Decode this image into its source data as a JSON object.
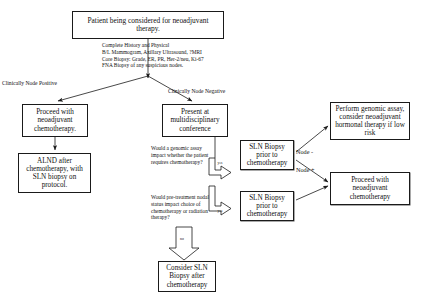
{
  "diagram": {
    "colors": {
      "background": "#ffffff",
      "stroke": "#1a1a1a",
      "text": "#111111"
    },
    "nodes": {
      "root": "Patient being considered for neoadjuvant therapy.",
      "proceed_neoadjuvant": "Proceed with neoadjuvant chemotherapy.",
      "alnd": "ALND after chemotherapy, with SLN biopsy on protocol.",
      "conference": "Present at multidisciplinary conference",
      "sln_biopsy_top": "SLN Biopsy prior to chemotherapy",
      "sln_biopsy_bottom": "SLN Biopsy prior to chemotherapy",
      "genomic_assay": "Perform genomic assay, consider neoadjuvant hormonal therapy if low risk",
      "proceed_neoadjuvant_right": "Proceed with neoadjuvant chemotherapy",
      "consider_sln": "Consider SLN Biopsy after chemotherapy"
    },
    "annotations": {
      "workup": "Complete History and Physical\nB/L Mammogram, Axillary Ultrasound, ?MRI\nCore Biopsy: Grade, ER, PR, Her-2/neu, Ki-67\nFNA Biopsy of any suspicious nodes.",
      "question_genomic": "Would a genomic assay impact whether the patient requires chemotherapy?",
      "question_nodal": "Would pre-treatment nodal status impact choice of chemotherapy or radiation therapy?"
    },
    "edge_labels": {
      "clinically_node_positive": "Clinically Node Positive",
      "clinically_node_negative": "Clinically Node Negative",
      "node_negative": "Node -",
      "node_positive": "Node +",
      "yes_genomic": "yes",
      "yes_nodal": "yes",
      "no_nodal": "no"
    }
  }
}
